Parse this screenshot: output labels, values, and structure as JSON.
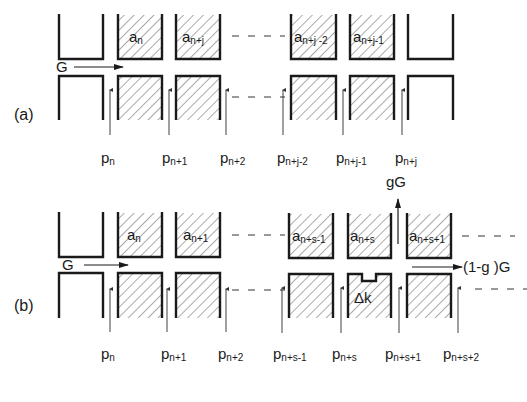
{
  "diagram": {
    "type": "tube-series schematic",
    "hatch_color": "#555555",
    "line_color": "#1a1a1a",
    "part_a": {
      "label": "(a)",
      "flow_label": "G",
      "cells": [
        "a_n",
        "a_n+j",
        "a_n+j-2",
        "a_n+j-1"
      ],
      "cell_labels": {
        "c1": {
          "base": "a",
          "sub": "n"
        },
        "c2": {
          "base": "a",
          "sub": "n+j"
        },
        "c3": {
          "base": "a",
          "sub": "n+j -2"
        },
        "c4": {
          "base": "a",
          "sub": "n+j-1"
        }
      },
      "pressure_labels": [
        {
          "base": "p",
          "sub": "n"
        },
        {
          "base": "p",
          "sub": "n+1"
        },
        {
          "base": "p",
          "sub": "n+2"
        },
        {
          "base": "p",
          "sub": "n+j-2"
        },
        {
          "base": "p",
          "sub": "n+j-1"
        },
        {
          "base": "p",
          "sub": "n+j"
        }
      ]
    },
    "part_b": {
      "label": "(b)",
      "flow_label": "G",
      "up_flow_label": "gG",
      "out_flow_label": "(1-g )G",
      "defect_label": "Δk",
      "cell_labels": {
        "c1": {
          "base": "a",
          "sub": "n"
        },
        "c2": {
          "base": "a",
          "sub": "n+1"
        },
        "c3": {
          "base": "a",
          "sub": "n+s-1"
        },
        "c4": {
          "base": "a",
          "sub": "n+s"
        },
        "c5": {
          "base": "a",
          "sub": "n+s+1"
        }
      },
      "pressure_labels": [
        {
          "base": "p",
          "sub": "n"
        },
        {
          "base": "p",
          "sub": "n+1"
        },
        {
          "base": "p",
          "sub": "n+2"
        },
        {
          "base": "p",
          "sub": "n+s-1"
        },
        {
          "base": "p",
          "sub": "n+s"
        },
        {
          "base": "p",
          "sub": "n+s+1"
        },
        {
          "base": "p",
          "sub": "n+s+2"
        }
      ]
    }
  }
}
